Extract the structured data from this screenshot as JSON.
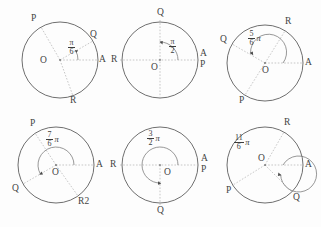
{
  "figure": {
    "background_color": "#fdfdfd",
    "stroke_color": "#4a4a4a",
    "dashed_color": "#a9a9a9",
    "text_color": "#3c3c3c",
    "columns": 3,
    "rows": 2
  },
  "panels": [
    {
      "id": "panel-1",
      "angle_label": {
        "numerator": "π",
        "denominator": "6",
        "pi_suffix": "",
        "display": "π/6",
        "layout": "stacked"
      },
      "angle_degrees": 30,
      "center_label": "O",
      "points": [
        {
          "name": "A",
          "angle_degrees": 0,
          "position": "right"
        },
        {
          "name": "Q",
          "angle_degrees": 30,
          "position": "upper-right"
        },
        {
          "name": "P",
          "angle_degrees": 120,
          "position": "upper-left"
        },
        {
          "name": "R",
          "angle_degrees": 290,
          "position": "lower-right"
        }
      ],
      "arc_direction": "clockwise-arrow-at-end"
    },
    {
      "id": "panel-2",
      "angle_label": {
        "numerator": "π",
        "denominator": "2",
        "pi_suffix": "",
        "display": "π/2",
        "layout": "stacked"
      },
      "angle_degrees": 90,
      "center_label": "O",
      "points": [
        {
          "name": "A",
          "angle_degrees": 0,
          "position": "right-upper"
        },
        {
          "name": "P",
          "angle_degrees": 0,
          "position": "right-lower"
        },
        {
          "name": "Q",
          "angle_degrees": 90,
          "position": "top"
        },
        {
          "name": "R",
          "angle_degrees": 180,
          "position": "left"
        }
      ],
      "arc_direction": "counterclockwise-arrow-at-end"
    },
    {
      "id": "panel-3",
      "angle_label": {
        "numerator": "5",
        "denominator": "6",
        "pi_suffix": "π",
        "display": "5π/6",
        "layout": "stacked-with-pi"
      },
      "angle_degrees": 150,
      "center_label": "O",
      "points": [
        {
          "name": "A",
          "angle_degrees": 0,
          "position": "right"
        },
        {
          "name": "R",
          "angle_degrees": 58,
          "position": "upper-right"
        },
        {
          "name": "Q",
          "angle_degrees": 150,
          "position": "upper-left"
        },
        {
          "name": "P",
          "angle_degrees": 238,
          "position": "lower-left"
        }
      ],
      "arc_direction": "counterclockwise-arrow-at-end"
    },
    {
      "id": "panel-4",
      "angle_label": {
        "numerator": "7",
        "denominator": "6",
        "pi_suffix": "π",
        "display": "7π/6",
        "layout": "stacked-with-pi"
      },
      "angle_degrees": 210,
      "center_label": "O",
      "points": [
        {
          "name": "A",
          "angle_degrees": 0,
          "position": "right"
        },
        {
          "name": "R",
          "angle_degrees": 0,
          "position": "right-second"
        },
        {
          "name": "P",
          "angle_degrees": 123,
          "position": "upper-left"
        },
        {
          "name": "Q",
          "angle_degrees": 210,
          "position": "lower-left"
        },
        {
          "name": "R2",
          "angle_degrees": 305,
          "position": "lower-right"
        }
      ],
      "arc_direction": "counterclockwise-arrow-at-end"
    },
    {
      "id": "panel-5",
      "angle_label": {
        "numerator": "3",
        "denominator": "2",
        "pi_suffix": "π",
        "display": "3π/2",
        "layout": "stacked-with-pi"
      },
      "angle_degrees": 270,
      "center_label": "O",
      "points": [
        {
          "name": "R",
          "angle_degrees": 180,
          "position": "left"
        },
        {
          "name": "A",
          "angle_degrees": 0,
          "position": "right-upper"
        },
        {
          "name": "P",
          "angle_degrees": 0,
          "position": "right-lower"
        },
        {
          "name": "Q",
          "angle_degrees": 270,
          "position": "bottom"
        }
      ],
      "arc_direction": "counterclockwise-arrow-at-end"
    },
    {
      "id": "panel-6",
      "angle_label": {
        "numerator": "11",
        "denominator": "6",
        "pi_suffix": "π",
        "display": "11π/6",
        "layout": "stacked-with-pi"
      },
      "angle_degrees": 330,
      "center_label": "O",
      "points": [
        {
          "name": "A",
          "angle_degrees": 0,
          "position": "right"
        },
        {
          "name": "R",
          "angle_degrees": 60,
          "position": "upper-right"
        },
        {
          "name": "P",
          "angle_degrees": 212,
          "position": "lower-left"
        },
        {
          "name": "Q",
          "angle_degrees": 315,
          "position": "lower-right"
        }
      ],
      "arc_direction": "clockwise-arrow-at-end"
    }
  ]
}
